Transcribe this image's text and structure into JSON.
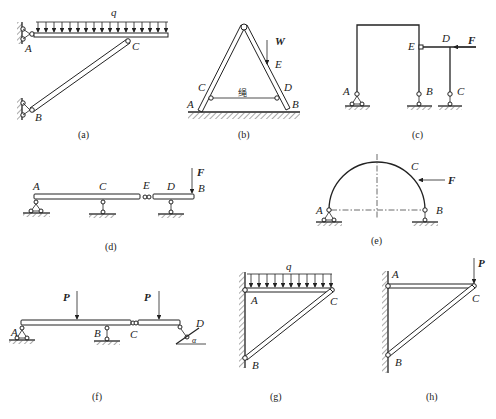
{
  "figure": {
    "panels": [
      {
        "id": "a",
        "caption": "(a)",
        "labels": {
          "load": "q",
          "A": "A",
          "B": "B",
          "C": "C"
        }
      },
      {
        "id": "b",
        "caption": "(b)",
        "labels": {
          "W": "W",
          "E": "E",
          "C": "C",
          "D": "D",
          "A": "A",
          "B": "B",
          "rope": "绳"
        }
      },
      {
        "id": "c",
        "caption": "(c)",
        "labels": {
          "A": "A",
          "B": "B",
          "C": "C",
          "D": "D",
          "E": "E",
          "F": "F"
        }
      },
      {
        "id": "d",
        "caption": "(d)",
        "labels": {
          "A": "A",
          "C": "C",
          "E": "E",
          "D": "D",
          "B": "B",
          "F": "F"
        }
      },
      {
        "id": "e",
        "caption": "(e)",
        "labels": {
          "A": "A",
          "B": "B",
          "C": "C",
          "F": "F"
        }
      },
      {
        "id": "f",
        "caption": "(f)",
        "labels": {
          "P1": "P",
          "P2": "P",
          "A": "A",
          "B": "B",
          "C": "C",
          "D": "D",
          "alpha": "α"
        }
      },
      {
        "id": "g",
        "caption": "(g)",
        "labels": {
          "load": "q",
          "A": "A",
          "B": "B",
          "C": "C"
        }
      },
      {
        "id": "h",
        "caption": "(h)",
        "labels": {
          "P": "P",
          "A": "A",
          "B": "B",
          "C": "C"
        }
      }
    ]
  }
}
